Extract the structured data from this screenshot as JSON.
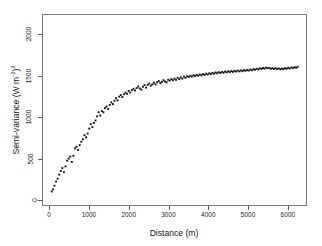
{
  "chart_data": {
    "type": "scatter",
    "title": "",
    "xlabel": "Distance (m)",
    "ylabel_text": "Semi-variance (W m",
    "ylabel_exp1": "-2",
    "ylabel_mid": ")",
    "ylabel_exp2": "2",
    "ylabel_plain": "Semi-variance (W m-2)2",
    "xlim": [
      -180,
      6480
    ],
    "ylim": [
      -70,
      2245
    ],
    "xticks": [
      0,
      1000,
      2000,
      3000,
      4000,
      5000,
      6000
    ],
    "xticklabels": [
      "0",
      "1000",
      "2000",
      "3000",
      "4000",
      "5000",
      "6000"
    ],
    "yticks": [
      0,
      500,
      1000,
      1500,
      2000
    ],
    "yticklabels": [
      "0",
      "500",
      "1000",
      "1500",
      "2000"
    ],
    "grid": false,
    "legend": null,
    "marker": "filled-square",
    "marker_size_px": 1.9,
    "marker_color": "#111111",
    "frame_color": "#7a7a7a",
    "background": "#ffffff",
    "model_hint": {
      "nugget": 40,
      "sill": 1600,
      "range_exponential": 1450
    },
    "x": [
      40,
      75,
      110,
      150,
      190,
      230,
      270,
      310,
      350,
      390,
      430,
      470,
      510,
      550,
      590,
      630,
      670,
      710,
      750,
      790,
      830,
      870,
      910,
      950,
      990,
      1030,
      1070,
      1110,
      1150,
      1190,
      1230,
      1270,
      1310,
      1350,
      1390,
      1430,
      1470,
      1510,
      1550,
      1590,
      1630,
      1670,
      1710,
      1750,
      1790,
      1830,
      1870,
      1910,
      1950,
      1990,
      2030,
      2070,
      2110,
      2150,
      2190,
      2230,
      2270,
      2310,
      2350,
      2390,
      2430,
      2470,
      2510,
      2550,
      2590,
      2630,
      2670,
      2710,
      2750,
      2790,
      2830,
      2870,
      2910,
      2950,
      2990,
      3030,
      3070,
      3110,
      3150,
      3190,
      3230,
      3270,
      3310,
      3350,
      3390,
      3430,
      3470,
      3510,
      3550,
      3590,
      3630,
      3670,
      3710,
      3750,
      3790,
      3830,
      3870,
      3910,
      3950,
      3990,
      4030,
      4070,
      4110,
      4150,
      4190,
      4230,
      4270,
      4310,
      4350,
      4390,
      4430,
      4470,
      4510,
      4550,
      4590,
      4630,
      4670,
      4710,
      4750,
      4790,
      4830,
      4870,
      4910,
      4950,
      4990,
      5030,
      5070,
      5110,
      5150,
      5190,
      5230,
      5270,
      5310,
      5350,
      5390,
      5430,
      5470,
      5510,
      5550,
      5590,
      5630,
      5670,
      5710,
      5750,
      5790,
      5830,
      5870,
      5910,
      5950,
      5990,
      6030,
      6070,
      6110,
      6150,
      6190,
      6230,
      6270
    ],
    "y": [
      95,
      120,
      165,
      215,
      250,
      300,
      345,
      380,
      330,
      400,
      470,
      495,
      520,
      455,
      530,
      620,
      640,
      600,
      660,
      700,
      730,
      780,
      755,
      800,
      860,
      915,
      880,
      930,
      960,
      1010,
      1060,
      1020,
      1075,
      1060,
      1110,
      1130,
      1100,
      1150,
      1180,
      1160,
      1200,
      1230,
      1205,
      1250,
      1270,
      1245,
      1280,
      1300,
      1285,
      1320,
      1300,
      1330,
      1345,
      1325,
      1355,
      1375,
      1350,
      1335,
      1370,
      1390,
      1360,
      1395,
      1410,
      1385,
      1400,
      1420,
      1400,
      1425,
      1440,
      1415,
      1430,
      1450,
      1435,
      1425,
      1455,
      1445,
      1465,
      1450,
      1470,
      1455,
      1480,
      1465,
      1485,
      1470,
      1495,
      1480,
      1500,
      1490,
      1505,
      1495,
      1510,
      1500,
      1515,
      1505,
      1520,
      1510,
      1525,
      1515,
      1530,
      1520,
      1535,
      1525,
      1540,
      1530,
      1545,
      1535,
      1548,
      1538,
      1552,
      1542,
      1556,
      1546,
      1558,
      1550,
      1562,
      1552,
      1565,
      1556,
      1568,
      1558,
      1570,
      1560,
      1572,
      1565,
      1575,
      1568,
      1580,
      1572,
      1585,
      1578,
      1590,
      1582,
      1596,
      1588,
      1600,
      1592,
      1604,
      1596,
      1600,
      1590,
      1598,
      1588,
      1596,
      1586,
      1594,
      1584,
      1592,
      1586,
      1598,
      1590,
      1602,
      1594,
      1606,
      1598,
      1610,
      1602,
      1614,
      1606,
      1620,
      1612,
      1626
    ]
  }
}
